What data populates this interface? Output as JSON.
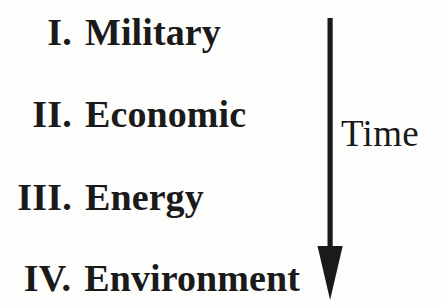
{
  "figure": {
    "background_color": "#fdfdfc",
    "ink_color": "#1a1a1a"
  },
  "list": {
    "items": [
      {
        "numeral": "I.",
        "label": "Military"
      },
      {
        "numeral": "II.",
        "label": "Economic"
      },
      {
        "numeral": "III.",
        "label": "Energy"
      },
      {
        "numeral": "IV.",
        "label": "Environment"
      }
    ]
  },
  "time_axis": {
    "label": "Time",
    "direction": "down",
    "arrow_icon": "arrow-down-icon",
    "color": "#1a1a1a"
  }
}
